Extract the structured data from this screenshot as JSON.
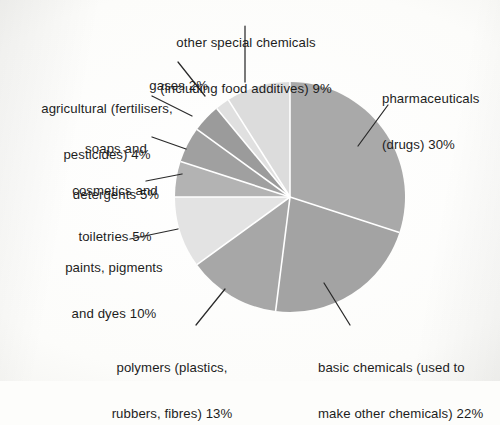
{
  "chart_data": {
    "type": "pie",
    "title": "",
    "subtitle": "",
    "xlabel": "",
    "ylabel": "",
    "units": "percent",
    "legend_position": "none",
    "grid": false,
    "start_angle_deg": 0,
    "direction": "clockwise",
    "categories": [
      "pharmaceuticals (drugs)",
      "basic chemicals (used to make other chemicals)",
      "polymers (plastics, rubbers, fibres)",
      "paints, pigments and dyes",
      "cosmetics and toiletries",
      "soaps and detergents",
      "agricultural (fertilisers, pesticides)",
      "gases",
      "other special chemicals (including food additives)"
    ],
    "values": [
      30,
      22,
      13,
      10,
      5,
      5,
      4,
      2,
      9
    ],
    "colors": [
      "#a9a9a9",
      "#a3a3a3",
      "#a7a7a7",
      "#e3e3e3",
      "#b3b3b3",
      "#a0a0a0",
      "#9b9b9b",
      "#e0e0e0",
      "#dcdcdc"
    ],
    "slice_separator_color": "#ffffff",
    "labels": [
      {
        "key": "pharmaceuticals",
        "line1": "pharmaceuticals",
        "line2": "(drugs) 30%",
        "percent": 30
      },
      {
        "key": "basic_chemicals",
        "line1": "basic chemicals (used to",
        "line2": "make other chemicals) 22%",
        "percent": 22
      },
      {
        "key": "polymers",
        "line1": "polymers (plastics,",
        "line2": "rubbers, fibres) 13%",
        "percent": 13
      },
      {
        "key": "paints",
        "line1": "paints, pigments",
        "line2": "and dyes 10%",
        "percent": 10
      },
      {
        "key": "cosmetics",
        "line1": "cosmetics and",
        "line2": "toiletries 5%",
        "percent": 5
      },
      {
        "key": "soaps",
        "line1": "soaps and",
        "line2": "detergents 5%",
        "percent": 5
      },
      {
        "key": "agricultural",
        "line1": "agricultural (fertilisers,",
        "line2": "pesticides) 4%",
        "percent": 4
      },
      {
        "key": "gases",
        "line1": "gases 2%",
        "line2": "",
        "percent": 2
      },
      {
        "key": "other_special",
        "line1": "other special chemicals",
        "line2": "(including food additives) 9%",
        "percent": 9
      }
    ]
  },
  "labels": {
    "pharmaceuticals_l1": "pharmaceuticals",
    "pharmaceuticals_l2": "(drugs) 30%",
    "basic_l1": "basic chemicals (used to",
    "basic_l2": "make other chemicals) 22%",
    "polymers_l1": "polymers (plastics,",
    "polymers_l2": "rubbers, fibres) 13%",
    "paints_l1": "paints, pigments",
    "paints_l2": "and dyes 10%",
    "cosmetics_l1": "cosmetics and",
    "cosmetics_l2": "toiletries 5%",
    "soaps_l1": "soaps and",
    "soaps_l2": "detergents 5%",
    "agricultural_l1": "agricultural (fertilisers,",
    "agricultural_l2": "pesticides) 4%",
    "gases_l1": "gases 2%",
    "other_l1": "other special chemicals",
    "other_l2": "(including food additives) 9%"
  },
  "style": {
    "background": "#fdfdfb",
    "text_color": "#1d1d1d",
    "leader_line_color": "#2a2a2a",
    "pie_center_x": 290,
    "pie_center_y": 197,
    "pie_radius": 115
  }
}
